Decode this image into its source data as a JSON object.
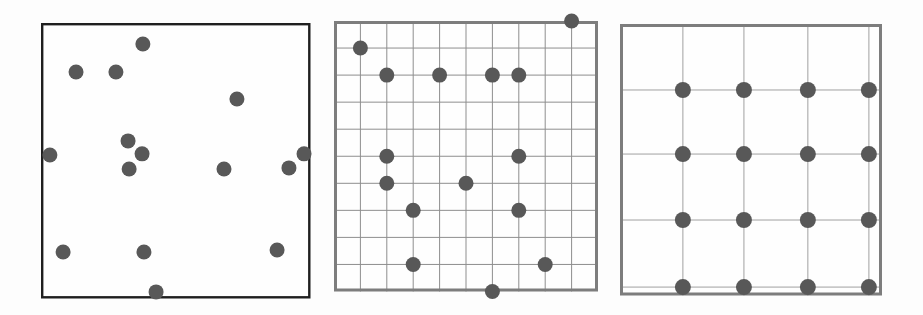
{
  "figure": {
    "background": "#fdfdfd",
    "width": 923,
    "height": 315
  },
  "dot": {
    "color": "#585858"
  },
  "panels": [
    {
      "id": "random-points",
      "frame": {
        "x": 41,
        "y": 23,
        "width": 269.5,
        "height": 275.5
      },
      "fill": "#fefefe",
      "border": {
        "color": "#1f1f1f",
        "width": 2.4
      },
      "dot_radius": 7.5,
      "grid": null,
      "points": [
        [
          0.378,
          0.076
        ],
        [
          0.13,
          0.178
        ],
        [
          0.278,
          0.178
        ],
        [
          0.727,
          0.276
        ],
        [
          0.323,
          0.428
        ],
        [
          0.033,
          0.479
        ],
        [
          0.375,
          0.475
        ],
        [
          0.976,
          0.475
        ],
        [
          0.327,
          0.53
        ],
        [
          0.679,
          0.53
        ],
        [
          0.92,
          0.526
        ],
        [
          0.082,
          0.831
        ],
        [
          0.382,
          0.831
        ],
        [
          0.876,
          0.824
        ],
        [
          0.427,
          0.976
        ]
      ]
    },
    {
      "id": "fine-grid-random-points",
      "frame": {
        "x": 334,
        "y": 21,
        "width": 264,
        "height": 270.5
      },
      "fill": "#fefefe",
      "border": {
        "color": "#7d7d7d",
        "width": 3
      },
      "dot_radius": 7.5,
      "grid": {
        "mode": "uniform",
        "divisions": 10,
        "color": "#8e8e8e",
        "line_width": 1
      },
      "points_lattice": [
        [
          9,
          0
        ],
        [
          1,
          1
        ],
        [
          2,
          2
        ],
        [
          4,
          2
        ],
        [
          6,
          2
        ],
        [
          7,
          2
        ],
        [
          2,
          5
        ],
        [
          7,
          5
        ],
        [
          2,
          6
        ],
        [
          5,
          6
        ],
        [
          3,
          7
        ],
        [
          7,
          7
        ],
        [
          3,
          9
        ],
        [
          8,
          9
        ],
        [
          6,
          10
        ]
      ]
    },
    {
      "id": "regular-grid-points",
      "frame": {
        "x": 620,
        "y": 24,
        "width": 262,
        "height": 271.5
      },
      "fill": "#fefefe",
      "border": {
        "color": "#7d7d7d",
        "width": 3
      },
      "dot_radius": 8,
      "grid": {
        "mode": "fractions",
        "x_fractions": [
          0.24,
          0.473,
          0.717,
          0.95
        ],
        "y_fractions": [
          0.243,
          0.479,
          0.722,
          0.969
        ],
        "color": "#a0a0a0",
        "line_width": 1
      },
      "points_at_intersections": true
    }
  ]
}
